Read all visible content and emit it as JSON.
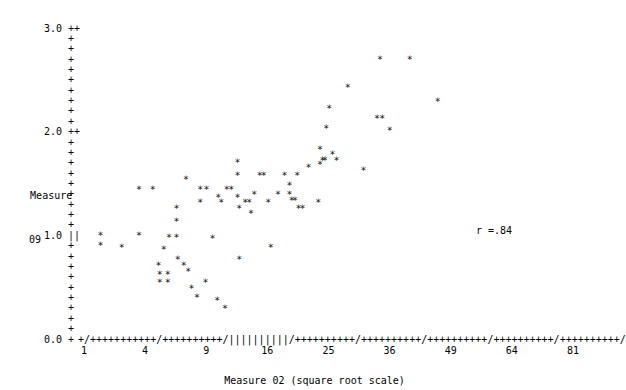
{
  "chart_data": {
    "type": "scatter",
    "title": "",
    "xlabel": "Measure 02 (square root scale)",
    "ylabel": "Measure 09",
    "ylabel_lines": [
      "Measure",
      "09"
    ],
    "annotation": "r =.84",
    "correlation": 0.84,
    "grid": false,
    "legend": null,
    "x_scale": "sqrt",
    "y_scale": "linear",
    "xlim": [
      1,
      81
    ],
    "ylim": [
      0.0,
      3.0
    ],
    "x_tick_labels": [
      "1",
      "4",
      "9",
      "16",
      "25",
      "36",
      "49",
      "64",
      "81"
    ],
    "x_ticks": [
      1,
      4,
      9,
      16,
      25,
      36,
      49,
      64,
      81
    ],
    "y_tick_labels": [
      "3.0",
      "2.0",
      "1.0",
      "0.0"
    ],
    "y_ticks": [
      3.0,
      2.0,
      1.0,
      0.0
    ],
    "axis_char": "+",
    "axis_tick_char": "/",
    "marker": "*",
    "n_points": 96,
    "points": [
      {
        "x": 1.6,
        "y": 1.02
      },
      {
        "x": 1.6,
        "y": 0.92
      },
      {
        "x": 2.6,
        "y": 0.9
      },
      {
        "x": 3.6,
        "y": 1.46
      },
      {
        "x": 3.6,
        "y": 1.02
      },
      {
        "x": 4.5,
        "y": 1.46
      },
      {
        "x": 4.9,
        "y": 0.73
      },
      {
        "x": 5.0,
        "y": 0.64
      },
      {
        "x": 5.0,
        "y": 0.56
      },
      {
        "x": 5.3,
        "y": 0.88
      },
      {
        "x": 5.6,
        "y": 0.64
      },
      {
        "x": 5.6,
        "y": 0.56
      },
      {
        "x": 5.7,
        "y": 1.0
      },
      {
        "x": 6.3,
        "y": 1.28
      },
      {
        "x": 6.3,
        "y": 1.15
      },
      {
        "x": 6.3,
        "y": 1.0
      },
      {
        "x": 6.4,
        "y": 0.79
      },
      {
        "x": 7.1,
        "y": 1.56
      },
      {
        "x": 7.3,
        "y": 0.67
      },
      {
        "x": 7.6,
        "y": 0.51
      },
      {
        "x": 8.1,
        "y": 0.42
      },
      {
        "x": 8.4,
        "y": 1.34
      },
      {
        "x": 8.4,
        "y": 1.46
      },
      {
        "x": 9.0,
        "y": 1.46
      },
      {
        "x": 9.6,
        "y": 0.99
      },
      {
        "x": 10.2,
        "y": 1.38
      },
      {
        "x": 10.5,
        "y": 1.34
      },
      {
        "x": 11.1,
        "y": 1.46
      },
      {
        "x": 11.6,
        "y": 1.46
      },
      {
        "x": 12.3,
        "y": 1.72
      },
      {
        "x": 12.3,
        "y": 1.6
      },
      {
        "x": 12.3,
        "y": 1.38
      },
      {
        "x": 12.5,
        "y": 1.28
      },
      {
        "x": 12.5,
        "y": 0.79
      },
      {
        "x": 13.2,
        "y": 1.34
      },
      {
        "x": 13.7,
        "y": 1.34
      },
      {
        "x": 13.9,
        "y": 1.23
      },
      {
        "x": 14.3,
        "y": 1.41
      },
      {
        "x": 15.0,
        "y": 1.6
      },
      {
        "x": 15.5,
        "y": 1.6
      },
      {
        "x": 16.1,
        "y": 1.34
      },
      {
        "x": 16.4,
        "y": 0.9
      },
      {
        "x": 17.4,
        "y": 1.41
      },
      {
        "x": 18.3,
        "y": 1.6
      },
      {
        "x": 19.0,
        "y": 1.41
      },
      {
        "x": 19.0,
        "y": 1.5
      },
      {
        "x": 19.3,
        "y": 1.36
      },
      {
        "x": 19.8,
        "y": 1.36
      },
      {
        "x": 20.1,
        "y": 1.6
      },
      {
        "x": 20.3,
        "y": 1.28
      },
      {
        "x": 20.9,
        "y": 1.28
      },
      {
        "x": 21.8,
        "y": 1.67
      },
      {
        "x": 23.3,
        "y": 1.34
      },
      {
        "x": 23.6,
        "y": 1.85
      },
      {
        "x": 23.6,
        "y": 1.7
      },
      {
        "x": 24.0,
        "y": 1.74
      },
      {
        "x": 24.4,
        "y": 1.74
      },
      {
        "x": 24.6,
        "y": 2.05
      },
      {
        "x": 25.1,
        "y": 2.24
      },
      {
        "x": 25.6,
        "y": 1.8
      },
      {
        "x": 26.3,
        "y": 1.74
      },
      {
        "x": 28.2,
        "y": 2.45
      },
      {
        "x": 31.0,
        "y": 1.64
      },
      {
        "x": 33.5,
        "y": 2.15
      },
      {
        "x": 34.5,
        "y": 2.15
      },
      {
        "x": 34.1,
        "y": 2.72
      },
      {
        "x": 36.0,
        "y": 2.03
      },
      {
        "x": 40.0,
        "y": 2.72
      },
      {
        "x": 46.0,
        "y": 2.31
      },
      {
        "x": 10.9,
        "y": 0.31
      },
      {
        "x": 10.1,
        "y": 0.39
      },
      {
        "x": 6.9,
        "y": 0.73
      },
      {
        "x": 8.9,
        "y": 0.56
      }
    ]
  },
  "plot": {
    "y_axis_rows": [
      {
        "label": "3.0",
        "tick": "++"
      },
      {
        "label": "",
        "tick": "+"
      },
      {
        "label": "",
        "tick": "+"
      },
      {
        "label": "",
        "tick": "+"
      },
      {
        "label": "",
        "tick": "+"
      },
      {
        "label": "",
        "tick": "+"
      },
      {
        "label": "",
        "tick": "+"
      },
      {
        "label": "",
        "tick": "+"
      },
      {
        "label": "",
        "tick": "+"
      },
      {
        "label": "",
        "tick": "+"
      },
      {
        "label": "2.0",
        "tick": "++"
      },
      {
        "label": "",
        "tick": "+"
      },
      {
        "label": "",
        "tick": "+"
      },
      {
        "label": "",
        "tick": "+"
      },
      {
        "label": "",
        "tick": "+"
      },
      {
        "label": "Measure",
        "tick": "+"
      },
      {
        "label": "",
        "tick": "+"
      },
      {
        "label": "09",
        "tick": "+"
      },
      {
        "label": "",
        "tick": "+"
      },
      {
        "label": "",
        "tick": "+"
      },
      {
        "label": "1.0",
        "tick": "||"
      },
      {
        "label": "",
        "tick": "+"
      },
      {
        "label": "",
        "tick": "+"
      },
      {
        "label": "",
        "tick": "+"
      },
      {
        "label": "",
        "tick": "+"
      },
      {
        "label": "",
        "tick": "+"
      },
      {
        "label": "",
        "tick": "+"
      },
      {
        "label": "",
        "tick": "+"
      },
      {
        "label": "",
        "tick": "+"
      },
      {
        "label": "",
        "tick": "+"
      },
      {
        "label": "0.0",
        "tick": "+"
      }
    ],
    "x_axis_line": "+/+++++++++++/++++++++++/||||||||||/++++++++++/++++++++++/++++++++++/++++++++++/++++++++++/",
    "background_color": "#ffffff",
    "ink_color": "#000000"
  }
}
